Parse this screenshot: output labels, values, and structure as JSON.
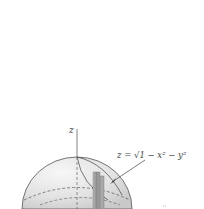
{
  "figure": {
    "axis_label_z": "z",
    "equation_label": "z = √1 − x² − y²",
    "surface_description": "upper hemisphere of unit sphere",
    "colors": {
      "background": "#ffffff",
      "sphere_fill": "#e4e4e4",
      "sphere_edge": "#555555",
      "column_fill": "#9a9a9a",
      "axis": "#666666"
    }
  }
}
